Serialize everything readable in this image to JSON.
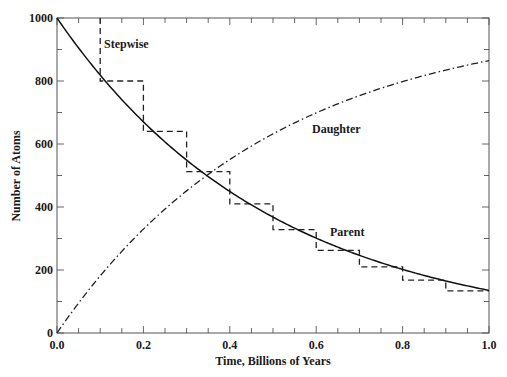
{
  "chart_data": {
    "type": "line",
    "title": "",
    "xlabel": "Time, Billions of Years",
    "ylabel": "Number of Atoms",
    "xlim": [
      0.0,
      1.0
    ],
    "ylim": [
      0,
      1000
    ],
    "x_ticks": [
      0.0,
      0.2,
      0.4,
      0.6,
      0.8,
      1.0
    ],
    "x_tick_labels": [
      "0.0",
      "0.2",
      "0.4",
      "0.6",
      "0.8",
      "1.0"
    ],
    "x_minor_step": 0.05,
    "y_ticks": [
      0,
      200,
      400,
      600,
      800,
      1000
    ],
    "y_tick_labels": [
      "0",
      "200",
      "400",
      "600",
      "800",
      "1000"
    ],
    "y_minor_step": 100,
    "grid": false,
    "legend": "none (inline annotations)",
    "series": [
      {
        "name": "Parent",
        "style": "solid",
        "x": [
          0.0,
          0.1,
          0.2,
          0.3,
          0.4,
          0.5,
          0.6,
          0.7,
          0.8,
          0.9,
          1.0
        ],
        "values": [
          1000,
          818,
          670,
          548,
          449,
          367,
          301,
          246,
          202,
          165,
          135
        ]
      },
      {
        "name": "Daughter",
        "style": "dash-dot",
        "x": [
          0.0,
          0.1,
          0.2,
          0.3,
          0.4,
          0.5,
          0.6,
          0.7,
          0.8,
          0.9,
          1.0
        ],
        "values": [
          0,
          182,
          330,
          452,
          551,
          633,
          699,
          754,
          798,
          835,
          865
        ]
      },
      {
        "name": "Stepwise",
        "style": "dashed-step",
        "x": [
          0.1,
          0.2,
          0.3,
          0.4,
          0.5,
          0.6,
          0.7,
          0.8,
          0.9,
          1.0
        ],
        "values": [
          800,
          640,
          512,
          410,
          328,
          262,
          210,
          168,
          134,
          134
        ],
        "start_value": 1000,
        "step_width": 0.1
      }
    ],
    "annotations": [
      {
        "text": "Stepwise",
        "x": 0.12,
        "y": 935
      },
      {
        "text": "Daughter",
        "x": 0.57,
        "y": 635
      },
      {
        "text": "Parent",
        "x": 0.64,
        "y": 310
      }
    ],
    "decay_constant_per_Gyr": 2.0
  },
  "labels": {
    "xlabel": "Time, Billions of Years",
    "ylabel": "Number of Atoms",
    "stepwise": "Stepwise",
    "daughter": "Daughter",
    "parent": "Parent"
  }
}
